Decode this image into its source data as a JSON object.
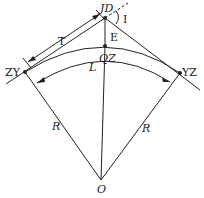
{
  "labels": {
    "jd": "JD",
    "deflection_angle": "I",
    "tangent": "T",
    "external": "E",
    "zy": "ZY",
    "qz": "QZ",
    "yz": "YZ",
    "length": "L",
    "radius_left": "R",
    "radius_right": "R",
    "center": "O"
  }
}
